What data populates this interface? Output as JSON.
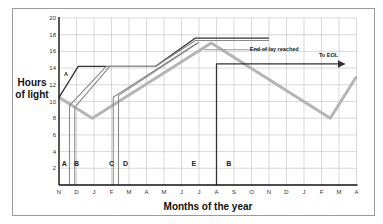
{
  "chart_data": {
    "type": "line",
    "title": "",
    "xlabel": "Months of the year",
    "ylabel": "Hours of light",
    "ylim": [
      0,
      20
    ],
    "yticks": [
      2,
      4,
      6,
      8,
      10,
      12,
      14,
      16,
      18,
      20
    ],
    "x_categories": [
      "N",
      "D",
      "J",
      "F",
      "M",
      "A",
      "M",
      "J",
      "J",
      "A",
      "S",
      "O",
      "N",
      "D",
      "J",
      "F",
      "M",
      "A"
    ],
    "grid": true,
    "series": [
      {
        "name": "Natural daylight",
        "style": "thick-light-grey",
        "points": [
          [
            0,
            10.5
          ],
          [
            1.9,
            8
          ],
          [
            8.7,
            17
          ],
          [
            15.5,
            8
          ],
          [
            17,
            13
          ]
        ]
      },
      {
        "name": "Lighting programme A",
        "style": "dark",
        "points": [
          [
            0,
            10.5
          ],
          [
            1.1,
            14.2
          ],
          [
            5.5,
            14.2
          ],
          [
            7.8,
            17.6
          ],
          [
            12,
            17.6
          ]
        ]
      },
      {
        "name": "Lighting programme B",
        "style": "grey",
        "points": [
          [
            0.6,
            0
          ],
          [
            0.6,
            9.5
          ],
          [
            2.7,
            14.2
          ],
          [
            5.5,
            14.2
          ],
          [
            7.8,
            17.3
          ],
          [
            12,
            17.3
          ]
        ]
      },
      {
        "name": "Lighting programme B2",
        "style": "grey",
        "points": [
          [
            0.9,
            0
          ],
          [
            0.9,
            9.3
          ],
          [
            2.9,
            14.2
          ]
        ]
      },
      {
        "name": "Lighting programme C",
        "style": "grey",
        "points": [
          [
            3.1,
            0
          ],
          [
            3.1,
            10.5
          ],
          [
            7.9,
            17
          ]
        ]
      },
      {
        "name": "Lighting programme D",
        "style": "grey",
        "points": [
          [
            3.4,
            0
          ],
          [
            3.4,
            10.7
          ],
          [
            8.0,
            17.1
          ]
        ]
      },
      {
        "name": "End of lay line",
        "style": "grey-thin",
        "points": [
          [
            8.3,
            16.2
          ],
          [
            12,
            16.2
          ]
        ]
      },
      {
        "name": "Programme E/B switch",
        "style": "dark",
        "points": [
          [
            9,
            0
          ],
          [
            9,
            14.5
          ],
          [
            16.3,
            14.5
          ]
        ],
        "arrow": true
      }
    ],
    "stem_labels": [
      {
        "text": "A",
        "x": 0.3,
        "y": 2.5
      },
      {
        "text": "B",
        "x": 1.0,
        "y": 2.5
      },
      {
        "text": "C",
        "x": 3.0,
        "y": 2.5
      },
      {
        "text": "D",
        "x": 3.8,
        "y": 2.5
      },
      {
        "text": "E",
        "x": 7.7,
        "y": 2.5
      },
      {
        "text": "B",
        "x": 9.7,
        "y": 2.5
      }
    ],
    "annotations": [
      {
        "text": "A",
        "x": 0.4,
        "y": 13
      },
      {
        "text": "End of lay reached",
        "x": 12.3,
        "y": 16.1
      },
      {
        "text": "To EOL",
        "x": 15.4,
        "y": 15.3
      }
    ]
  }
}
